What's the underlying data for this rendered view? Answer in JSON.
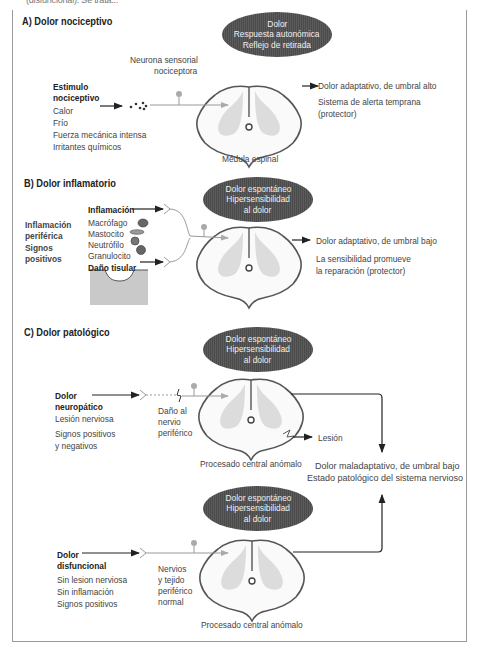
{
  "cropped_header": "(disfuncional). Se trata...",
  "colors": {
    "ellipse_fill": "#4f4f4f",
    "ellipse_text": "#f0f0f0",
    "cord_outline": "#555555",
    "cord_grey_matter": "#d9d9d9",
    "neuron": "#999999",
    "frame_border": "#9a9a9a"
  },
  "sections": {
    "a": {
      "title": "A) Dolor nociceptivo",
      "ellipse": [
        "Dolor",
        "Respuesta autonómica",
        "Reflejo de retirada"
      ],
      "neuron_label": [
        "Neurona sensorial",
        "nociceptora"
      ],
      "stimulus_title": [
        "Estimulo",
        "nociceptivo"
      ],
      "stimulus_items": [
        "Calor",
        "Frío",
        "Fuerza mecánica intensa",
        "Irritantes químicos"
      ],
      "cord_label": "Médula espinal",
      "outcome_title": "Dolor adaptativo, de umbral alto",
      "outcome_desc": [
        "Sistema de alerta temprana",
        "(protector)"
      ]
    },
    "b": {
      "title": "B) Dolor inflamatorio",
      "ellipse": [
        "Dolor espontáneo",
        "Hipersensibilidad",
        "al dolor"
      ],
      "side_label": [
        "Inflamación",
        "periférica",
        "Signos",
        "positivos"
      ],
      "inflammation_label": "Inflamación",
      "cells": [
        "Macrófago",
        "Mastocito",
        "Neutrófilo",
        "Granulocito"
      ],
      "tissue_label": "Daño tisular",
      "outcome_title": "Dolor adaptativo, de umbral bajo",
      "outcome_desc": [
        "La sensibilidad promueve",
        "la reparación (protector)"
      ]
    },
    "c": {
      "title": "C) Dolor patológico",
      "neuro": {
        "ellipse": [
          "Dolor espontáneo",
          "Hipersensibilidad",
          "al dolor"
        ],
        "title": [
          "Dolor",
          "neuropático"
        ],
        "items": [
          "Lesión nerviosa",
          "Signos positivos",
          "y negativos"
        ],
        "nerve_label": [
          "Daño al",
          "nervio",
          "periférico"
        ],
        "cord_label": "Procesado central anómalo",
        "lesion_label": "Lesión"
      },
      "outcome_title": "Dolor maladaptativo, de umbral bajo",
      "outcome_desc": "Estado patológico del sistema nervioso",
      "dys": {
        "ellipse": [
          "Dolor espontáneo",
          "Hipersensibilidad",
          "al dolor"
        ],
        "title": [
          "Dolor",
          "disfuncional"
        ],
        "items": [
          "Sin lesion nerviosa",
          "Sin inflamación",
          "Signos positivos"
        ],
        "nerve_label": [
          "Nervios",
          "y tejido",
          "periférico",
          "normal"
        ],
        "cord_label": "Procesado central anómalo"
      }
    }
  }
}
